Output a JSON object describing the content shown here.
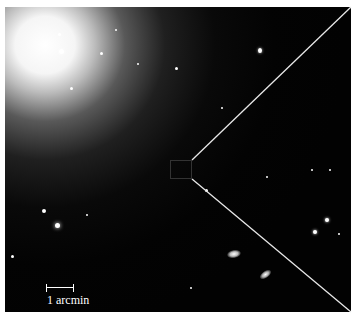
{
  "image": {
    "subject": "elliptical galaxy astronomical photograph",
    "background_color": "#020202",
    "galaxy_center": {
      "x": 165,
      "y": 165
    }
  },
  "zoom_box": {
    "x": 170,
    "y": 160,
    "width": 22,
    "height": 19
  },
  "zoom_lines": [
    {
      "from": {
        "x": 192,
        "y": 160
      },
      "to": {
        "x": 351,
        "y": 7
      }
    },
    {
      "from": {
        "x": 192,
        "y": 179
      },
      "to": {
        "x": 351,
        "y": 312
      }
    }
  ],
  "scale_bar": {
    "label": "1 arcmin",
    "x": 46,
    "y": 284,
    "width": 28
  }
}
